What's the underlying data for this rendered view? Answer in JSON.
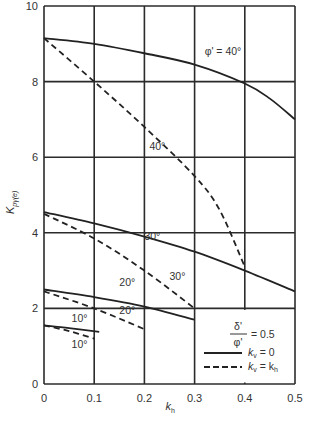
{
  "chart_data": {
    "type": "line",
    "title": "",
    "xlabel": "k_h",
    "ylabel": "K_pγ(e)",
    "xlim": [
      0,
      0.5
    ],
    "ylim": [
      0,
      10
    ],
    "xticks": [
      0,
      0.1,
      0.2,
      0.3,
      0.4,
      0.5
    ],
    "xtick_labels": [
      "0",
      "0.1",
      "0.2",
      "0.3",
      "0.4",
      "0.5"
    ],
    "yticks": [
      0,
      2,
      4,
      6,
      8,
      10
    ],
    "ytick_labels": [
      "0",
      "2",
      "4",
      "6",
      "8",
      "10"
    ],
    "grid": true,
    "legend": {
      "position": "lower right",
      "ratio_label_num": "δ'",
      "ratio_label_den": "φ'",
      "ratio_value": "= 0.5",
      "entries": [
        {
          "style": "solid",
          "label_var": "k",
          "label_sub": "v",
          "label_rest": " = 0"
        },
        {
          "style": "dashed",
          "label_var": "k",
          "label_sub": "v",
          "label_rest": " = k",
          "label_sub2": "h"
        }
      ]
    },
    "series": [
      {
        "name": "φ' = 40°, k_v = 0",
        "style": "solid",
        "x": [
          0,
          0.1,
          0.2,
          0.3,
          0.4,
          0.45,
          0.5
        ],
        "y": [
          9.15,
          9.0,
          8.75,
          8.45,
          7.95,
          7.55,
          7.0
        ]
      },
      {
        "name": "φ' = 40°, k_v = k_h",
        "style": "dashed",
        "x": [
          0,
          0.1,
          0.2,
          0.3,
          0.35,
          0.4
        ],
        "y": [
          9.15,
          8.0,
          6.8,
          5.5,
          4.6,
          3.1
        ]
      },
      {
        "name": "φ' = 30°, k_v = 0",
        "style": "solid",
        "x": [
          0,
          0.1,
          0.2,
          0.3,
          0.4,
          0.5
        ],
        "y": [
          4.55,
          4.25,
          3.9,
          3.5,
          3.0,
          2.45
        ]
      },
      {
        "name": "φ' = 30°, k_v = k_h",
        "style": "dashed",
        "x": [
          0,
          0.1,
          0.2,
          0.3
        ],
        "y": [
          4.5,
          3.85,
          3.0,
          2.0
        ]
      },
      {
        "name": "φ' = 20°, k_v = 0",
        "style": "solid",
        "x": [
          0,
          0.1,
          0.2,
          0.3
        ],
        "y": [
          2.5,
          2.3,
          2.05,
          1.7
        ]
      },
      {
        "name": "φ' = 20°, k_v = k_h",
        "style": "dashed",
        "x": [
          0,
          0.1,
          0.2
        ],
        "y": [
          2.45,
          2.0,
          1.45
        ]
      },
      {
        "name": "φ' = 10°, k_v = 0",
        "style": "solid",
        "x": [
          0,
          0.05,
          0.11
        ],
        "y": [
          1.55,
          1.48,
          1.38
        ]
      },
      {
        "name": "φ' = 10°, k_v = k_h",
        "style": "dashed",
        "x": [
          0,
          0.05,
          0.1
        ],
        "y": [
          1.55,
          1.4,
          1.2
        ]
      }
    ],
    "annotations": [
      {
        "text": "φ' = 40°",
        "x": 0.32,
        "y": 8.7
      },
      {
        "text": "40°",
        "x": 0.21,
        "y": 6.2
      },
      {
        "text": "30°",
        "x": 0.2,
        "y": 3.8
      },
      {
        "text": "30°",
        "x": 0.25,
        "y": 2.75
      },
      {
        "text": "20°",
        "x": 0.15,
        "y": 2.6
      },
      {
        "text": "20°",
        "x": 0.15,
        "y": 1.85
      },
      {
        "text": "10°",
        "x": 0.055,
        "y": 1.65
      },
      {
        "text": "10°",
        "x": 0.055,
        "y": 0.95
      }
    ]
  }
}
